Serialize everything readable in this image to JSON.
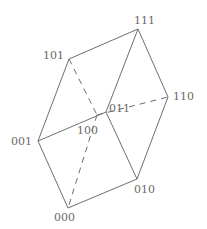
{
  "diagram": {
    "type": "cube",
    "title": "",
    "vertices": [
      {
        "id": "000",
        "label": "000",
        "x": 68,
        "y": 208,
        "lx": 54,
        "ly": 221
      },
      {
        "id": "001",
        "label": "001",
        "x": 38,
        "y": 141,
        "lx": 11,
        "ly": 145
      },
      {
        "id": "010",
        "label": "010",
        "x": 137,
        "y": 179,
        "lx": 134,
        "ly": 193
      },
      {
        "id": "011",
        "label": "011",
        "x": 106,
        "y": 112,
        "lx": 109,
        "ly": 112
      },
      {
        "id": "100",
        "label": "100",
        "x": 97,
        "y": 115,
        "lx": 77,
        "ly": 134
      },
      {
        "id": "101",
        "label": "101",
        "x": 69,
        "y": 59,
        "lx": 43,
        "ly": 59
      },
      {
        "id": "110",
        "label": "110",
        "x": 168,
        "y": 97,
        "lx": 173,
        "ly": 100
      },
      {
        "id": "111",
        "label": "111",
        "x": 138,
        "y": 29,
        "lx": 134,
        "ly": 24
      }
    ],
    "edges": [
      {
        "from": "101",
        "to": "111",
        "style": "solid"
      },
      {
        "from": "111",
        "to": "011",
        "style": "solid"
      },
      {
        "from": "111",
        "to": "110",
        "style": "solid"
      },
      {
        "from": "101",
        "to": "001",
        "style": "solid"
      },
      {
        "from": "001",
        "to": "011",
        "style": "solid"
      },
      {
        "from": "011",
        "to": "010",
        "style": "solid"
      },
      {
        "from": "110",
        "to": "010",
        "style": "solid"
      },
      {
        "from": "001",
        "to": "000",
        "style": "solid"
      },
      {
        "from": "000",
        "to": "010",
        "style": "solid"
      },
      {
        "from": "101",
        "to": "100",
        "style": "dashed"
      },
      {
        "from": "100",
        "to": "110",
        "style": "dashed"
      },
      {
        "from": "100",
        "to": "000",
        "style": "dashed"
      }
    ],
    "colors": {
      "line": "#6e6e6e",
      "label": "#6a6a6a",
      "background": "#ffffff"
    }
  }
}
